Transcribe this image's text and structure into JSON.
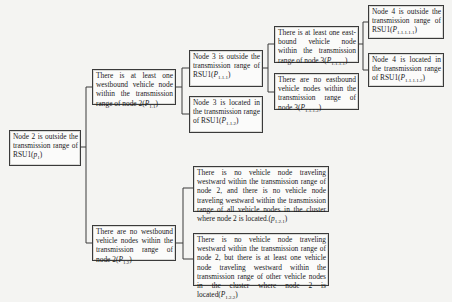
{
  "diagram": {
    "type": "decision-tree",
    "nodes": {
      "root": {
        "text": "Node 2 is outside the transmission range of RSU1(",
        "label_main": "p",
        "label_sub": "1",
        "close": ")"
      },
      "p11": {
        "text": "There is at least one westbound vehicle node within the transmission range of node 2(",
        "label_main": "P",
        "label_sub": "1.1",
        "close": ")"
      },
      "p12": {
        "text": "There are no westbound vehicle nodes within the transmission range of node 2(",
        "label_main": "P",
        "label_sub": "1.2",
        "close": ")"
      },
      "p111": {
        "text": "Node 3 is outside the transmission range of RSU1(",
        "label_main": "P",
        "label_sub": "1.1.1",
        "close": ")"
      },
      "p112": {
        "text": "Node 3 is located in the transmission range of RSU1(",
        "label_main": "P",
        "label_sub": "1.1.2",
        "close": ")"
      },
      "p1111": {
        "text": "There is at least one east-bound vehicle node within the transmission range of node 3(",
        "label_main": "P",
        "label_sub": "1.1.1.1",
        "close": ")"
      },
      "p1112": {
        "text": "There are no eastbound vehicle nodes within the transmission range of node 3(",
        "label_main": "P",
        "label_sub": "1.1.1.2",
        "close": ")"
      },
      "p11111": {
        "text": "Node 4 is outside the transmission range of RSU1(",
        "label_main": "P",
        "label_sub": "1.1.1.1.1",
        "close": ")"
      },
      "p11112": {
        "text": "Node 4 is located in the transmission range of RSU1(",
        "label_main": "P",
        "label_sub": "1.1.1.1.2",
        "close": ")"
      },
      "p121": {
        "text": "There is no vehicle node traveling westward within the transmission range of node 2, and there is no vehicle node traveling westward within the transmission range of all vehicle nodes in the cluster where node 2 is located.(",
        "label_main": "p",
        "label_sub": "1.2.1",
        "close": ")"
      },
      "p122": {
        "text": "There is no vehicle node traveling westward within the transmission range of node 2, but there is at least one vehicle node traveling westward within the transmission range of other vehicle nodes in the cluster where node 2 is located(",
        "label_main": "P",
        "label_sub": "1.2.2",
        "close": ")"
      }
    },
    "edges": [
      [
        "root",
        "p11"
      ],
      [
        "root",
        "p12"
      ],
      [
        "p11",
        "p111"
      ],
      [
        "p11",
        "p112"
      ],
      [
        "p111",
        "p1111"
      ],
      [
        "p111",
        "p1112"
      ],
      [
        "p1111",
        "p11111"
      ],
      [
        "p1111",
        "p11112"
      ],
      [
        "p12",
        "p121"
      ],
      [
        "p12",
        "p122"
      ]
    ],
    "colors": {
      "background": "#f4f4f2",
      "box_border": "#3a3a3a",
      "text": "#1a1a1a"
    }
  }
}
